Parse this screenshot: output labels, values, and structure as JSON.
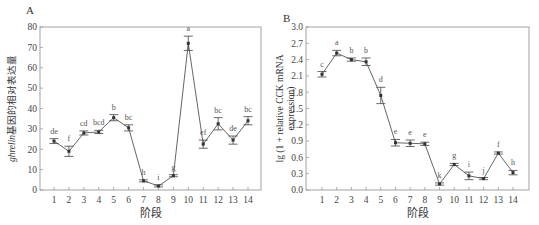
{
  "chart_data": [
    {
      "panel": "A",
      "type": "line",
      "title": "",
      "xlabel": "阶段",
      "ylabel_italic": "ghrelin",
      "ylabel_rest": "基因的相对表达量",
      "ylim": [
        0,
        80
      ],
      "yticks": [
        0,
        10,
        20,
        30,
        40,
        50,
        60,
        70,
        80
      ],
      "categories": [
        "1",
        "2",
        "3",
        "4",
        "5",
        "6",
        "7",
        "8",
        "9",
        "10",
        "11",
        "12",
        "13",
        "14"
      ],
      "values": [
        24,
        19,
        28,
        28.5,
        35.5,
        30.5,
        4.5,
        2,
        7,
        72,
        22.5,
        32.5,
        24.5,
        34
      ],
      "errors": [
        1.2,
        2.5,
        1.0,
        0.8,
        1.5,
        1.5,
        0.5,
        0.5,
        0.5,
        3.5,
        2.0,
        3.0,
        2.0,
        2.0
      ],
      "significance": [
        "de",
        "f",
        "cd",
        "bcd",
        "b",
        "bc",
        "h",
        "i",
        "g",
        "a",
        "ef",
        "bc",
        "de",
        "bc"
      ],
      "grid": false,
      "legend": false
    },
    {
      "panel": "B",
      "type": "line",
      "title": "",
      "xlabel": "阶段",
      "ylabel": "lg (1 + relative CCK mRNA expression)",
      "ylabel_line1": "lg (1 + relative CCK mRNA",
      "ylabel_line2": "expression)",
      "ylim": [
        0,
        3.0
      ],
      "yticks": [
        "0.0",
        "0.3",
        "0.6",
        "0.9",
        "1.2",
        "1.5",
        "1.8",
        "2.1",
        "2.4",
        "2.7",
        "3.0"
      ],
      "categories": [
        "1",
        "2",
        "3",
        "4",
        "5",
        "6",
        "7",
        "8",
        "9",
        "10",
        "11",
        "12",
        "13",
        "14"
      ],
      "values": [
        2.13,
        2.52,
        2.4,
        2.36,
        1.74,
        0.87,
        0.86,
        0.85,
        0.11,
        0.47,
        0.26,
        0.21,
        0.68,
        0.32
      ],
      "errors": [
        0.05,
        0.05,
        0.03,
        0.07,
        0.15,
        0.06,
        0.06,
        0.03,
        0.02,
        0.02,
        0.07,
        0.02,
        0.02,
        0.04
      ],
      "significance": [
        "c",
        "a",
        "b",
        "b",
        "d",
        "e",
        "e",
        "e",
        "k",
        "g",
        "i",
        "j",
        "f",
        "h"
      ],
      "grid": false,
      "legend": false
    }
  ]
}
